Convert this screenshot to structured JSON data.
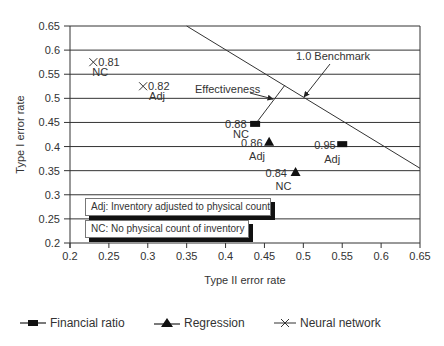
{
  "chart_data": {
    "type": "scatter",
    "title": "",
    "xlabel": "Type II error rate",
    "ylabel": "Type I error rate",
    "xlim": [
      0.2,
      0.65
    ],
    "ylim": [
      0.2,
      0.65
    ],
    "x_ticks": [
      "0.2",
      "0.25",
      "0.3",
      "0.35",
      "0.4",
      "0.45",
      "0.5",
      "0.55",
      "0.6",
      "0.65"
    ],
    "y_ticks": [
      "0.65",
      "0.6",
      "0.55",
      "0.5",
      "0.45",
      "0.4",
      "0.35",
      "0.3",
      "0.25",
      "0.2"
    ],
    "grid": "horizontal",
    "legend_position": "bottom",
    "series": [
      {
        "name": "Financial ratio",
        "marker": "square",
        "points": [
          {
            "x": 0.438,
            "y": 0.447,
            "value": "0.88",
            "tag": "NC"
          },
          {
            "x": 0.55,
            "y": 0.405,
            "value": "0.95",
            "tag": "Adj"
          }
        ]
      },
      {
        "name": "Regression",
        "marker": "triangle",
        "points": [
          {
            "x": 0.456,
            "y": 0.41,
            "value": "0.86",
            "tag": "Adj"
          },
          {
            "x": 0.49,
            "y": 0.347,
            "value": "0.84",
            "tag": "NC"
          }
        ]
      },
      {
        "name": "Neural network",
        "marker": "x",
        "points": [
          {
            "x": 0.23,
            "y": 0.575,
            "value": "0.81",
            "tag": "NC"
          },
          {
            "x": 0.294,
            "y": 0.525,
            "value": "0.82",
            "tag": "Adj"
          }
        ]
      }
    ],
    "reference_lines": [
      {
        "name": "1.0 Benchmark",
        "from": [
          0.35,
          0.65
        ],
        "to": [
          0.65,
          0.355
        ]
      }
    ],
    "annotations": [
      {
        "text": "1.0 Benchmark",
        "points_to": "benchmark line"
      },
      {
        "text": "Effectiveness",
        "points_to": "line from 0.88 NC point to benchmark line"
      }
    ],
    "notes": [
      "Adj: Inventory adjusted to physical count",
      "NC: No physical count of inventory"
    ]
  },
  "legend": {
    "items": [
      {
        "label": "Financial ratio",
        "icon": "square-marker-icon"
      },
      {
        "label": "Regression",
        "icon": "triangle-marker-icon"
      },
      {
        "label": "Neural network",
        "icon": "x-marker-icon"
      }
    ]
  }
}
